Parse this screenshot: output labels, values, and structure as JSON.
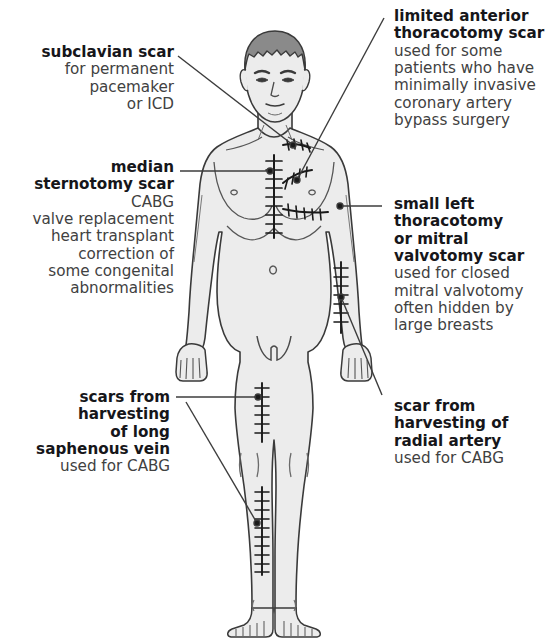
{
  "figure": {
    "colors": {
      "background": "#ffffff",
      "body_fill": "#ececec",
      "body_outline": "#3a3a3a",
      "hair_fill": "#8a8a8a",
      "hair_outline": "#3a3a3a",
      "scar_line": "#1a1a1a",
      "leader_line": "#3c3c3c",
      "label_heading": "#16161a",
      "label_body": "#414141"
    }
  },
  "callouts": {
    "subclavian": {
      "side": "left",
      "heading": [
        "subclavian scar"
      ],
      "body": [
        "for permanent",
        "pacemaker",
        "or ICD"
      ]
    },
    "median_sternotomy": {
      "side": "left",
      "heading": [
        "median",
        "sternotomy scar"
      ],
      "body": [
        "CABG",
        "valve replacement",
        "heart transplant",
        "correction of",
        "some congenital",
        "abnormalities"
      ]
    },
    "saphenous": {
      "side": "left",
      "heading": [
        "scars from",
        "harvesting",
        "of long",
        "saphenous vein"
      ],
      "body": [
        "used for CABG"
      ]
    },
    "limited_anterior_thoracotomy": {
      "side": "right",
      "heading": [
        "limited anterior",
        "thoracotomy scar"
      ],
      "body": [
        "used for some",
        "patients who have",
        "minimally invasive",
        "coronary artery",
        "bypass surgery"
      ]
    },
    "small_left_thoracotomy": {
      "side": "right",
      "heading": [
        "small left",
        "thoracotomy",
        "or mitral",
        "valvotomy scar"
      ],
      "body": [
        "used for closed",
        "mitral valvotomy",
        "often hidden by",
        "large breasts"
      ]
    },
    "radial_artery": {
      "side": "right",
      "heading": [
        "scar from",
        "harvesting of",
        "radial artery"
      ],
      "body": [
        "used for CABG"
      ]
    }
  },
  "scars": [
    {
      "name": "subclavian-scar",
      "region": "right infraclavicular"
    },
    {
      "name": "median-sternotomy-scar",
      "region": "midline sternum"
    },
    {
      "name": "limited-anterior-thoracotomy-scar",
      "region": "left upper chest oblique"
    },
    {
      "name": "small-left-thoracotomy-scar",
      "region": "left inframammary"
    },
    {
      "name": "radial-artery-harvest-scar",
      "region": "left forearm"
    },
    {
      "name": "long-saphenous-vein-scar-thigh",
      "region": "right medial thigh"
    },
    {
      "name": "long-saphenous-vein-scar-calf",
      "region": "right medial calf"
    }
  ]
}
